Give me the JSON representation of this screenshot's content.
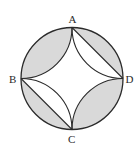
{
  "figure": {
    "width": 140,
    "height": 152,
    "circle": {
      "cx": 72,
      "cy": 78.5,
      "r": 51
    },
    "points": {
      "A": {
        "x": 72,
        "y": 27.5
      },
      "B": {
        "x": 21,
        "y": 78.5
      },
      "C": {
        "x": 72,
        "y": 129.5
      },
      "D": {
        "x": 123,
        "y": 78.5
      }
    },
    "labels": {
      "A": "A",
      "B": "B",
      "C": "C",
      "D": "D"
    },
    "chords": [
      "AD",
      "BC"
    ],
    "shaded_regions": [
      "lens between arc AB of circle and inner arc AB",
      "segment between arc AD of circle and chord AD",
      "segment between arc BC of circle and chord BC",
      "lens between arc CD of circle and inner arc CD"
    ],
    "colors": {
      "stroke": "#2a2a2a",
      "shade": "#d9d9d9",
      "background": "#ffffff"
    }
  }
}
